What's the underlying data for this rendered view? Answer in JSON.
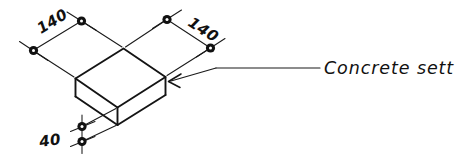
{
  "drawing": {
    "title": "Concrete sett isometric detail",
    "background_color": "#ffffff",
    "line_color": "#141414",
    "text_color": "#111111",
    "dimensions": {
      "width_label": "140",
      "depth_label": "140",
      "height_label": "40",
      "units_implied": "mm"
    },
    "annotation": {
      "label": "Concrete sett"
    }
  }
}
